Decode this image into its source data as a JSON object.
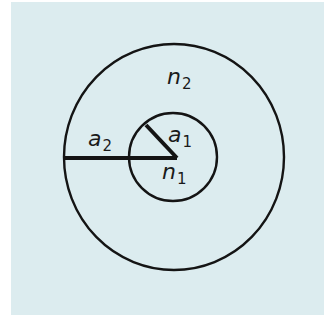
{
  "diagram": {
    "type": "concentric-circles",
    "background_color": "#dcecef",
    "stroke_color": "#141414",
    "outer_region": {
      "label_var": "n",
      "label_sub": "2",
      "description": "cladding refractive index"
    },
    "inner_region": {
      "label_var": "n",
      "label_sub": "1",
      "description": "core refractive index"
    },
    "outer_radius": {
      "label_var": "a",
      "label_sub": "2"
    },
    "inner_radius": {
      "label_var": "a",
      "label_sub": "1"
    }
  }
}
